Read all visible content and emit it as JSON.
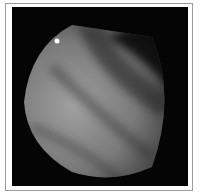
{
  "image": {
    "kind": "grayscale endoscopic view",
    "frame_color": "#9a9a9a",
    "background_color": "#050505",
    "tissue_tone_light": "#a8a8a8",
    "tissue_tone_dark": "#3a3a3a",
    "highlight_color": "#ffffff"
  }
}
